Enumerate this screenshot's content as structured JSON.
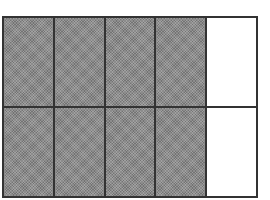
{
  "diagram": {
    "type": "fraction-grid",
    "rows": 2,
    "columns": 5,
    "total_cells": 10,
    "shaded_cells": 8,
    "unshaded_cells": 2,
    "fraction_shaded": "8/10",
    "colors": {
      "shaded": "#8c8c8c",
      "unshaded": "#ffffff",
      "border": "#333333"
    },
    "cells": [
      {
        "row": 1,
        "col": 1,
        "shaded": true
      },
      {
        "row": 1,
        "col": 2,
        "shaded": true
      },
      {
        "row": 1,
        "col": 3,
        "shaded": true
      },
      {
        "row": 1,
        "col": 4,
        "shaded": true
      },
      {
        "row": 1,
        "col": 5,
        "shaded": false
      },
      {
        "row": 2,
        "col": 1,
        "shaded": true
      },
      {
        "row": 2,
        "col": 2,
        "shaded": true
      },
      {
        "row": 2,
        "col": 3,
        "shaded": true
      },
      {
        "row": 2,
        "col": 4,
        "shaded": true
      },
      {
        "row": 2,
        "col": 5,
        "shaded": false
      }
    ]
  }
}
